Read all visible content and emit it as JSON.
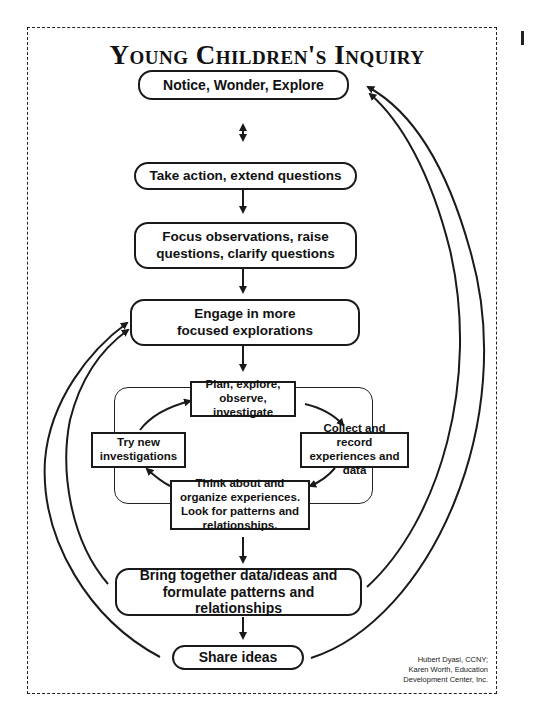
{
  "title": "Young Children's Inquiry",
  "nodes": {
    "notice": "Notice, Wonder, Explore",
    "take_action": "Take action, extend questions",
    "focus": "Focus observations, raise questions, clarify questions",
    "engage": "Engage in more focused explorations",
    "plan": "Plan, explore, observe, investigate",
    "collect": "Collect and record experiences and data",
    "think": "Think about and organize experiences. Look for patterns and relationships.",
    "try_new": "Try new investigations",
    "bring_together": "Bring together data/ideas and formulate patterns and relationships",
    "share": "Share ideas"
  },
  "credit": {
    "line1": "Hubert Dyasi, CCNY;",
    "line2": "Karen Worth, Education",
    "line3": "Development Center, Inc."
  },
  "colors": {
    "ink": "#1a1a1a",
    "background": "#ffffff"
  }
}
